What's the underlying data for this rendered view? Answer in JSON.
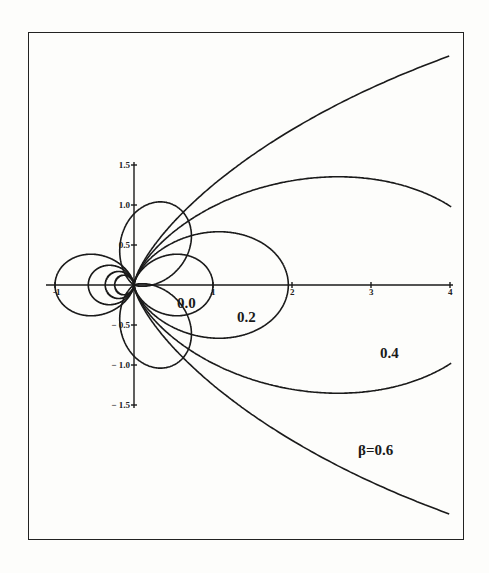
{
  "chart_data": {
    "type": "line",
    "title": "",
    "xlabel": "",
    "ylabel": "",
    "xlim": [
      -1,
      4
    ],
    "ylim": [
      -1.5,
      1.5
    ],
    "grid": false,
    "x_ticks": [
      {
        "value": -1,
        "label": "-1"
      },
      {
        "value": 1,
        "label": "1"
      },
      {
        "value": 2,
        "label": "2"
      },
      {
        "value": 3,
        "label": "3"
      },
      {
        "value": 4,
        "label": "4"
      }
    ],
    "y_ticks": [
      {
        "value": 1.5,
        "label": "1.5"
      },
      {
        "value": 1.0,
        "label": "1.0"
      },
      {
        "value": 0.5,
        "label": "0.5"
      },
      {
        "value": -0.5,
        "label": "-0.5"
      },
      {
        "value": -1.0,
        "label": "-1.0"
      },
      {
        "value": -1.5,
        "label": "-1.5"
      }
    ],
    "curve_model": "polar r(theta) = cos^2(theta) / (1 - beta*cos(theta))^3, plotted symmetric about x-axis",
    "series": [
      {
        "name": "0.0",
        "beta": 0.0,
        "label": "0.0",
        "right_extent": 1.0,
        "left_extent": -1.0,
        "max_y": 0.39
      },
      {
        "name": "0.2",
        "beta": 0.2,
        "label": "0.2",
        "right_extent": 1.96,
        "left_extent": -0.58,
        "max_y": 0.56
      },
      {
        "name": "0.4",
        "beta": 0.4,
        "label": "0.4",
        "left_extent": -0.38,
        "max_y": 1.05,
        "y_at_x4": 0.75
      },
      {
        "name": "0.6",
        "beta": 0.6,
        "label": "β=0.6",
        "y_at_x4": 2.0
      }
    ],
    "side_lobes": {
      "peak_angle_deg": 63,
      "peak_radius": 1.12,
      "mirrored": true
    }
  }
}
